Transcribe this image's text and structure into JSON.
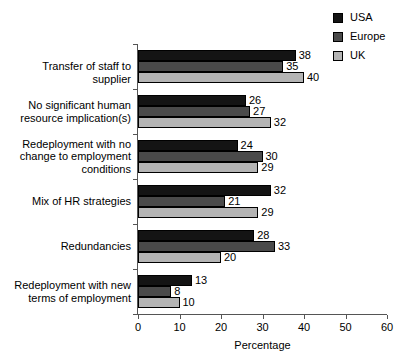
{
  "chart_data": {
    "type": "bar",
    "orientation": "horizontal",
    "title": "",
    "xlabel": "Percentage",
    "ylabel": "",
    "xlim": [
      0,
      60
    ],
    "xticks": [
      0,
      10,
      20,
      30,
      40,
      50,
      60
    ],
    "grid": false,
    "legend_position": "top-right",
    "categories": [
      "Transfer of staff to supplier",
      "No significant human\nresource implication(s)",
      "Redeployment with no\nchange  to employment\nconditions",
      "Mix of HR strategies",
      "Redundancies",
      "Redeployment with new\nterms of employment"
    ],
    "series": [
      {
        "name": "USA",
        "color": "#141414",
        "values": [
          38,
          26,
          24,
          32,
          28,
          13
        ]
      },
      {
        "name": "Europe",
        "color": "#4a4a4a",
        "values": [
          35,
          27,
          30,
          21,
          33,
          8
        ]
      },
      {
        "name": "UK",
        "color": "#b4b4b4",
        "values": [
          40,
          32,
          29,
          29,
          20,
          10
        ]
      }
    ]
  },
  "legend": {
    "items": [
      {
        "label": "USA"
      },
      {
        "label": "Europe"
      },
      {
        "label": "UK"
      }
    ]
  },
  "axis": {
    "x_title": "Percentage",
    "tick_labels": [
      "0",
      "10",
      "20",
      "30",
      "40",
      "50",
      "60"
    ]
  }
}
